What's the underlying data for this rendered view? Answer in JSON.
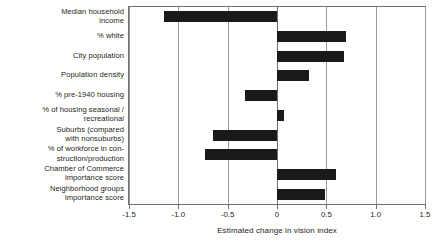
{
  "chart_data": {
    "type": "bar",
    "orientation": "horizontal",
    "title": "",
    "xlabel": "Estimated change in vision index",
    "ylabel": "",
    "xlim": [
      -1.5,
      1.5
    ],
    "xticks": [
      -1.5,
      -1.0,
      -0.5,
      0,
      0.5,
      1.0,
      1.5
    ],
    "xticklabels": [
      "-1.5",
      "-1.0",
      "-0.5",
      "0",
      "0.5",
      "1.0",
      "1.5"
    ],
    "grid": true,
    "legend": false,
    "categories": [
      "Median household income",
      "% white",
      "City population",
      "Population density",
      "% pre-1940 housing",
      "% of housing seasonal / recreational",
      "Suburbs (compared with nonsuburbs)",
      "% of workforce in con-struction/production",
      "Chamber of Commerce importance score",
      "Neighborhood groups importance score"
    ],
    "category_lines": [
      [
        "Median household",
        "income"
      ],
      [
        "% white"
      ],
      [
        "City population"
      ],
      [
        "Population density"
      ],
      [
        "% pre-1940 housing"
      ],
      [
        "% of housing seasonal /",
        "recreational"
      ],
      [
        "Suburbs (compared",
        "with nonsuburbs)"
      ],
      [
        "% of workforce in con-",
        "struction/production"
      ],
      [
        "Chamber of Commerce",
        "importance score"
      ],
      [
        "Neighborhood groups",
        "importance score"
      ]
    ],
    "values": [
      -1.15,
      0.7,
      0.68,
      0.32,
      -0.32,
      0.07,
      -0.65,
      -0.73,
      0.6,
      0.49
    ],
    "bar_color": "#1a1a1a"
  }
}
